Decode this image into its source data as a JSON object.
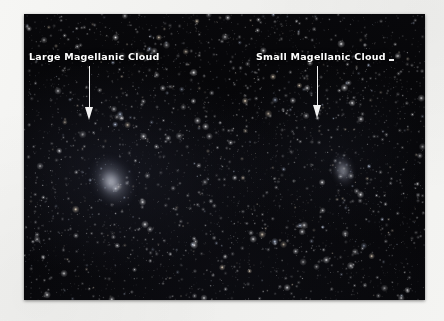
{
  "page": {
    "background_color": "#f3f3f1",
    "kind": "scanned-book-page"
  },
  "photo": {
    "type": "astronomical-photograph",
    "subject": "Magellanic Clouds in the southern night sky",
    "background_color": "#050506",
    "bounds": {
      "x": 24,
      "y": 14,
      "width": 401,
      "height": 286
    }
  },
  "annotations": [
    {
      "id": "lmc",
      "label": "Large Magellanic Cloud",
      "label_color": "#ffffff",
      "label_position": {
        "x": 29,
        "y": 52
      },
      "arrow": {
        "color": "#f2f2f2",
        "direction": "down",
        "from": {
          "x": 89,
          "y": 66
        },
        "to": {
          "x": 89,
          "y": 120
        }
      },
      "target_object": "Large Magellanic Cloud galaxy",
      "target_position": {
        "x": 89,
        "y": 165
      }
    },
    {
      "id": "smc",
      "label": "Small Magellanic Cloud",
      "label_color": "#ffffff",
      "label_position": {
        "x": 256,
        "y": 52
      },
      "trailing_mark": "·",
      "arrow": {
        "color": "#f2f2f2",
        "direction": "down",
        "from": {
          "x": 317,
          "y": 66
        },
        "to": {
          "x": 317,
          "y": 118
        }
      },
      "target_object": "Small Magellanic Cloud galaxy",
      "target_position": {
        "x": 318,
        "y": 156
      }
    }
  ],
  "objects": [
    {
      "name": "Large Magellanic Cloud",
      "x": 89,
      "y": 165,
      "appearance": "diffuse elongated glow"
    },
    {
      "name": "Small Magellanic Cloud",
      "x": 318,
      "y": 156,
      "appearance": "faint small elongated glow"
    }
  ]
}
